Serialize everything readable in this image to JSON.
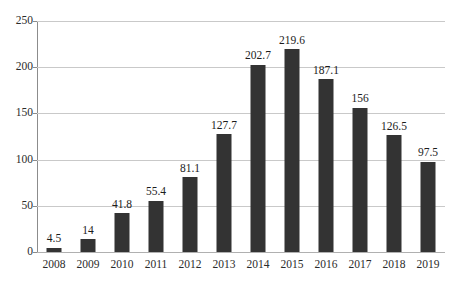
{
  "chart_data": {
    "type": "bar",
    "title": "",
    "subtitle": "",
    "xlabel": "",
    "ylabel": "",
    "categories": [
      "2008",
      "2009",
      "2010",
      "2011",
      "2012",
      "2013",
      "2014",
      "2015",
      "2016",
      "2017",
      "2018",
      "2019"
    ],
    "values": [
      4.5,
      14,
      41.8,
      55.4,
      81.1,
      127.7,
      202.7,
      219.6,
      187.1,
      156,
      126.5,
      97.5
    ],
    "value_labels": [
      "4.5",
      "14",
      "41.8",
      "55.4",
      "81.1",
      "127.7",
      "202.7",
      "219.6",
      "187.1",
      "156",
      "126.5",
      "97.5"
    ],
    "ylim": [
      0,
      250
    ],
    "yticks": [
      0,
      50,
      100,
      150,
      200,
      250
    ],
    "ytick_labels": [
      "0",
      "50",
      "100",
      "150",
      "200",
      "250"
    ],
    "grid": true,
    "legend": null,
    "series": [
      {
        "name": "",
        "values": [
          4.5,
          14,
          41.8,
          55.4,
          81.1,
          127.7,
          202.7,
          219.6,
          187.1,
          156,
          126.5,
          97.5
        ]
      }
    ],
    "colors": {
      "bar": "#333333",
      "gridline": "#c9c9c9",
      "axis": "#8c8c8c",
      "text": "#1c1c1c",
      "background": "#ffffff"
    }
  }
}
